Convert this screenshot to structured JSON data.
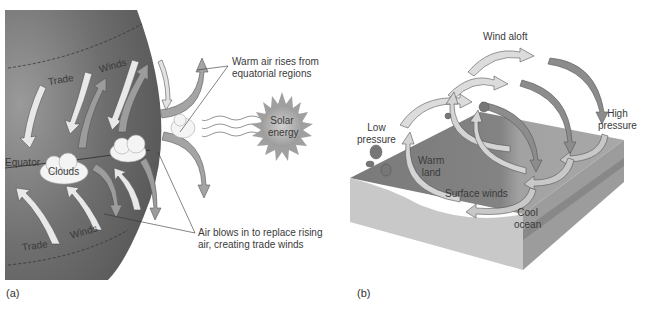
{
  "panel_a": {
    "label": "(a)",
    "texts": {
      "trade_top": "Trade",
      "winds_top": "Winds",
      "equator": "Equator",
      "clouds": "Clouds",
      "trade_bottom": "Trade",
      "winds_bottom": "Winds",
      "warm_air_line1": "Warm air rises from",
      "warm_air_line2": "equatorial regions",
      "solar_line1": "Solar",
      "solar_line2": "energy",
      "air_blows_line1": "Air blows in to replace rising",
      "air_blows_line2": "air, creating trade winds"
    }
  },
  "panel_b": {
    "label": "(b)",
    "texts": {
      "wind_aloft": "Wind aloft",
      "high_line1": "High",
      "high_line2": "pressure",
      "low_line1": "Low",
      "low_line2": "pressure",
      "warm_line1": "Warm",
      "warm_line2": "land",
      "surface_winds": "Surface winds",
      "cool_line1": "Cool",
      "cool_line2": "ocean"
    }
  },
  "colors": {
    "globe": "#6f6f6f",
    "arrow_light": "#e6e6e6",
    "arrow_dark": "#9a9a9a",
    "sun": "#a8a8a8",
    "land": "#7d7d7d",
    "ocean": "#a3a3a3"
  }
}
